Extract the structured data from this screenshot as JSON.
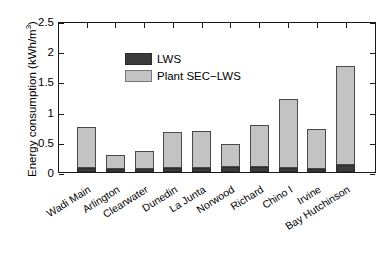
{
  "chart_data": {
    "type": "bar",
    "title": "",
    "xlabel": "",
    "ylabel": "Energy consumption (kWh/m",
    "ylabel_superscript": "3",
    "ylabel_suffix": ")",
    "ylim": [
      0,
      2.5
    ],
    "yticks": [
      0,
      0.5,
      1,
      1.5,
      2,
      2.5
    ],
    "ytick_labels": [
      "0",
      "0.5",
      "1",
      "1.5",
      "2",
      "2.5"
    ],
    "grid": false,
    "stacked": true,
    "legend_position": "upper-left-inside",
    "categories": [
      "Wadi Main",
      "Arlington",
      "Clearwater",
      "Dunedin",
      "La Junta",
      "Norwood",
      "Richard",
      "Chino I",
      "Irvine",
      "Bay Hutchinson"
    ],
    "series": [
      {
        "name": "LWS",
        "color": "#3b3b3b",
        "values": [
          0.06,
          0.05,
          0.05,
          0.06,
          0.06,
          0.09,
          0.09,
          0.06,
          0.05,
          0.12
        ]
      },
      {
        "name": "Plant SEC−LWS",
        "color": "#c3c3c3",
        "values": [
          0.69,
          0.23,
          0.3,
          0.6,
          0.62,
          0.37,
          0.69,
          1.15,
          0.66,
          1.63
        ]
      }
    ],
    "totals": [
      0.75,
      0.28,
      0.35,
      0.66,
      0.68,
      0.46,
      0.78,
      1.21,
      0.71,
      1.75
    ]
  },
  "legend": {
    "entries": [
      {
        "label": "LWS",
        "swatch": "lws"
      },
      {
        "label": "Plant SEC−LWS",
        "swatch": "sec"
      }
    ]
  },
  "colors": {
    "lws": "#3b3b3b",
    "plant_sec": "#c3c3c3",
    "axis": "#1a1a1a",
    "background": "#ffffff"
  }
}
